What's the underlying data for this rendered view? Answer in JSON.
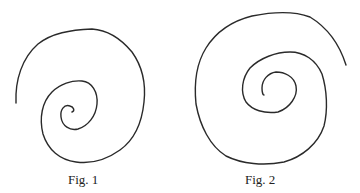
{
  "figures": [
    {
      "id": "fig1",
      "caption": "Fig. 1",
      "description": "Inward spiral, outer end at left, tight curl at center",
      "stroke_color": "#2a2a2a"
    },
    {
      "id": "fig2",
      "caption": "Fig. 2",
      "description": "Inward spiral, outer end at upper right, looser center",
      "stroke_color": "#2a2a2a"
    }
  ]
}
